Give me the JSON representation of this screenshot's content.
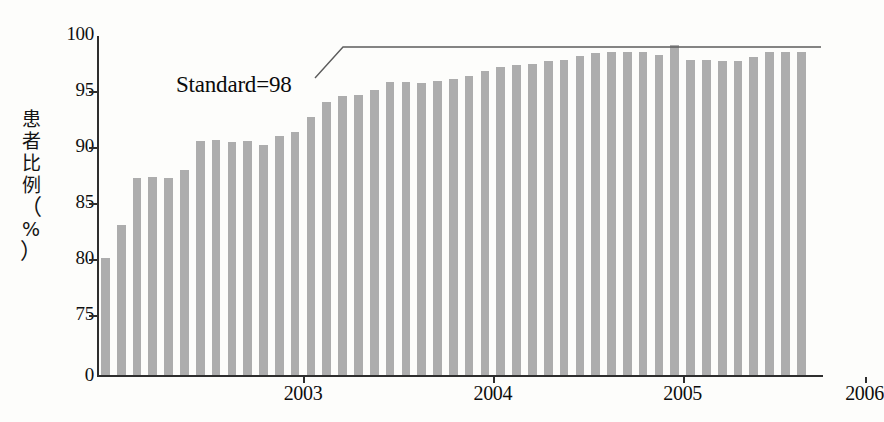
{
  "chart_data": {
    "type": "bar",
    "title": "",
    "xlabel": "",
    "ylabel": "患者比例（%）",
    "ylabel_chars": [
      "患",
      "者",
      "比",
      "例",
      "（",
      "%",
      "）"
    ],
    "ylim": [
      0,
      100
    ],
    "y_axis_broken": true,
    "y_break_note": "axis jumps from 0 to 75",
    "yticks": [
      {
        "label": "100",
        "value": 100
      },
      {
        "label": "95",
        "value": 95
      },
      {
        "label": "90",
        "value": 90
      },
      {
        "label": "85",
        "value": 85
      },
      {
        "label": "80",
        "value": 80
      },
      {
        "label": "75",
        "value": 75
      },
      {
        "label": "0",
        "value": 0
      }
    ],
    "xticks": [
      {
        "label": "2003",
        "index": 12.5
      },
      {
        "label": "2004",
        "index": 24.5
      },
      {
        "label": "2005",
        "index": 36.5
      },
      {
        "label": "2006",
        "index": 48.0
      }
    ],
    "x_tick_marks_index": [
      12.5,
      24.5,
      36.5,
      48.0
    ],
    "grid": false,
    "legend": false,
    "bar_color": "#adadad",
    "axis_color": "#2e2e2e",
    "categories": [
      "1",
      "2",
      "3",
      "4",
      "5",
      "6",
      "7",
      "8",
      "9",
      "10",
      "11",
      "12",
      "13",
      "14",
      "15",
      "16",
      "17",
      "18",
      "19",
      "20",
      "21",
      "22",
      "23",
      "24",
      "25",
      "26",
      "27",
      "28",
      "29",
      "30",
      "31",
      "32",
      "33",
      "34",
      "35",
      "36",
      "37",
      "38",
      "39",
      "40",
      "41",
      "42",
      "43",
      "44",
      "45"
    ],
    "values": [
      80.2,
      83.1,
      87.3,
      87.4,
      87.3,
      88.0,
      90.6,
      90.7,
      90.5,
      90.6,
      90.3,
      91.1,
      91.4,
      92.8,
      94.1,
      94.6,
      94.7,
      95.2,
      95.9,
      95.9,
      95.8,
      96.0,
      96.2,
      96.4,
      96.9,
      97.2,
      97.4,
      97.5,
      97.8,
      97.9,
      98.2,
      98.5,
      98.6,
      98.6,
      98.6,
      98.3,
      99.2,
      97.9,
      97.9,
      97.8,
      97.8,
      98.1,
      98.6,
      98.6,
      98.6
    ],
    "annotations": [
      {
        "text": "Standard=98",
        "value": 98,
        "type": "reference-line-callout"
      }
    ]
  }
}
